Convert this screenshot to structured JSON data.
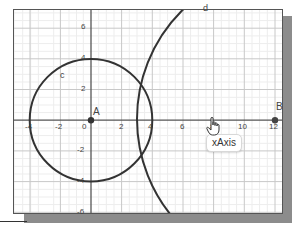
{
  "graphics_view": {
    "x_axis": {
      "name": "xAxis",
      "tick_labels": [
        "-4",
        "-2",
        "0",
        "2",
        "4",
        "6",
        "8",
        "10",
        "12"
      ]
    },
    "y_axis": {
      "tick_labels": [
        "6",
        "4",
        "2",
        "-2",
        "-4",
        "-6"
      ]
    },
    "points": [
      {
        "label": "A",
        "x": 0,
        "y": 0
      },
      {
        "label": "B",
        "x": 12,
        "y": 0
      }
    ],
    "objects": [
      {
        "label": "c",
        "type": "circle",
        "center": "A",
        "radius": 4
      },
      {
        "label": "d",
        "type": "circle"
      }
    ],
    "tooltip": "xAxis",
    "colors": {
      "object": "#333333",
      "axis": "#555555",
      "grid_major": "#c8c8c8",
      "grid_minor": "#ececec",
      "shadow": "#8c8c8c"
    }
  }
}
